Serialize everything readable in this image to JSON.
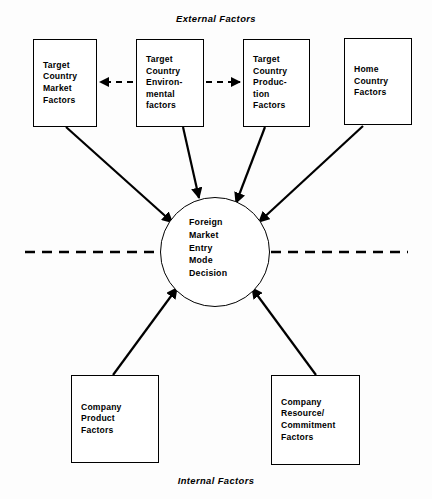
{
  "diagram": {
    "title_top": "External Factors",
    "title_bottom": "Internal Factors",
    "center": {
      "label": "Foreign\nMarket\nEntry\nMode\nDecision"
    },
    "external_nodes": [
      {
        "id": "target-country-market-factors",
        "label": "Target\nCountry\nMarket\nFactors"
      },
      {
        "id": "target-country-environmental-factors",
        "label": "Target\nCountry\nEnviron-\nmental\nfactors"
      },
      {
        "id": "target-country-production-factors",
        "label": "Target\nCountry\nProduc-\ntion\nFactors"
      },
      {
        "id": "home-country-factors",
        "label": "Home\nCountry\nFactors"
      }
    ],
    "internal_nodes": [
      {
        "id": "company-product-factors",
        "label": "Company\nProduct\nFactors"
      },
      {
        "id": "company-resource-commitment-factors",
        "label": "Company\nResource/\nCommitment\nFactors"
      }
    ],
    "colors": {
      "line": "#000000",
      "box_fill": "#ffffff",
      "background": "#fdfdfd"
    }
  }
}
